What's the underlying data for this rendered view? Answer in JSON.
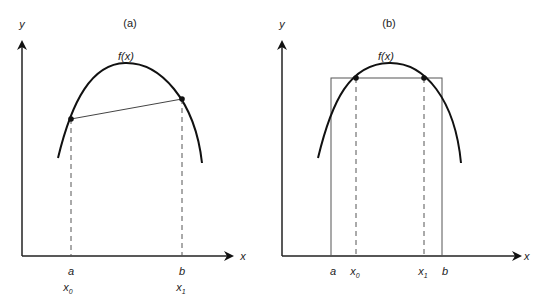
{
  "panels": [
    {
      "id": "a",
      "title": "(a)",
      "function_label": "f(x)",
      "y_axis_label": "y",
      "x_axis_label": "x",
      "points": [
        {
          "label_top": "a",
          "label_bottom": "x",
          "subscript": "0"
        },
        {
          "label_top": "b",
          "label_bottom": "x",
          "subscript": "1"
        }
      ],
      "description": "Secant line connecting f(a) and f(b) on a concave curve"
    },
    {
      "id": "b",
      "title": "(b)",
      "function_label": "f(x)",
      "y_axis_label": "y",
      "x_axis_label": "x",
      "interval_labels": [
        "a",
        "b"
      ],
      "points": [
        {
          "label": "x",
          "subscript": "0"
        },
        {
          "label": "x",
          "subscript": "1"
        }
      ],
      "description": "Rectangle over [a,b] with top edge intersecting the curve at x0 and x1"
    }
  ],
  "colors": {
    "curve": "#111111",
    "line": "#555555",
    "axis": "#222222"
  }
}
